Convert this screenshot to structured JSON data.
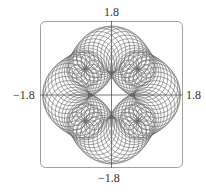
{
  "chart_data": {
    "type": "line",
    "title": "",
    "xlabel": "",
    "ylabel": "",
    "xlim": [
      -1.8,
      1.8
    ],
    "ylim": [
      -1.8,
      1.8
    ],
    "grid": false,
    "legend": null,
    "tick_labels": {
      "top": "1.8",
      "bottom": "−1.8",
      "left": "−1.8",
      "right": "1.8"
    },
    "colors": {
      "curve": "#555555",
      "frame": "#999999",
      "axes": "#555555"
    }
  }
}
